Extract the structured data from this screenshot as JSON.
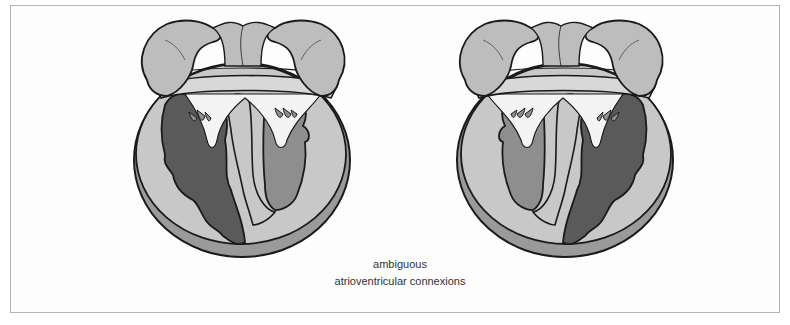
{
  "figure": {
    "caption": {
      "line1": "ambiguous",
      "line2": "atrioventricular connexions"
    },
    "hearts": [
      {
        "id": "left",
        "dark_ventricle_side": "left",
        "light_ventricle_side": "right"
      },
      {
        "id": "right",
        "dark_ventricle_side": "right",
        "light_ventricle_side": "left"
      }
    ],
    "colors": {
      "outline": "#1a1a1a",
      "wall": "#c8c8c8",
      "wall_rim": "#9a9a9a",
      "atria": "#bdbdbd",
      "dark_ventricle": "#5a5a5a",
      "mid_ventricle": "#8e8e8e",
      "valve_leaflets": "#f4f4f4",
      "frame_border": "#b4b4b4"
    }
  }
}
